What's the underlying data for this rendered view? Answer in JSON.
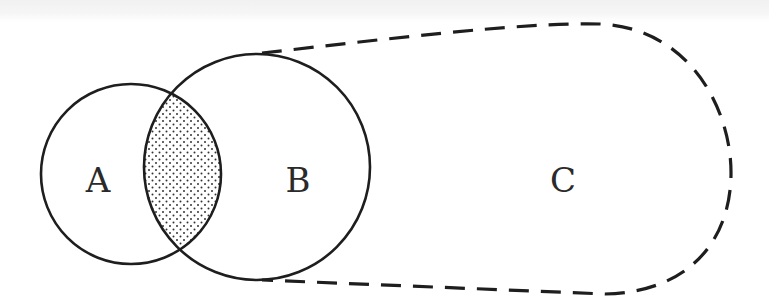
{
  "diagram": {
    "type": "venn",
    "sets": [
      {
        "id": "A",
        "label": "A",
        "style": "solid",
        "shape": "circle"
      },
      {
        "id": "B",
        "label": "B",
        "style": "solid",
        "shape": "circle"
      },
      {
        "id": "C",
        "label": "C",
        "style": "dashed",
        "shape": "closed-curve"
      }
    ],
    "shaded_region": "A ∩ B",
    "shading_pattern": "dots",
    "relations": [
      "B ⊂ C",
      "A overlaps B",
      "A overlaps C"
    ],
    "colors": {
      "stroke": "#1e1e1e",
      "background": "#ffffff",
      "dots": "#333333"
    }
  },
  "labels": {
    "a": "A",
    "b": "B",
    "c": "C"
  }
}
